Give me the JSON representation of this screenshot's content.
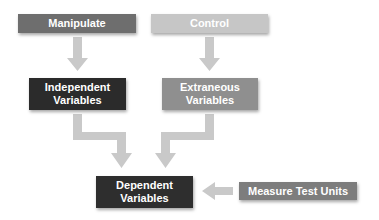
{
  "diagram": {
    "nodes": [
      {
        "id": "manipulate",
        "label": "Manipulate",
        "color": "#6e6e6e"
      },
      {
        "id": "control",
        "label": "Control",
        "color": "#c6c6c6"
      },
      {
        "id": "independent",
        "label": "Independent Variables",
        "line1": "Independent",
        "line2": "Variables",
        "color": "#2b2b2b"
      },
      {
        "id": "extraneous",
        "label": "Extraneous Variables",
        "line1": "Extraneous",
        "line2": "Variables",
        "color": "#8f8f8f"
      },
      {
        "id": "dependent",
        "label": "Dependent Variables",
        "line1": "Dependent",
        "line2": "Variables",
        "color": "#2e2e2e"
      },
      {
        "id": "measure",
        "label": "Measure Test Units",
        "color": "#7d7d7d"
      }
    ],
    "edges": [
      {
        "from": "manipulate",
        "to": "independent"
      },
      {
        "from": "control",
        "to": "extraneous"
      },
      {
        "from": "independent",
        "to": "dependent"
      },
      {
        "from": "extraneous",
        "to": "dependent"
      },
      {
        "from": "measure",
        "to": "dependent"
      }
    ],
    "arrow_color": "#c9c9c9"
  }
}
